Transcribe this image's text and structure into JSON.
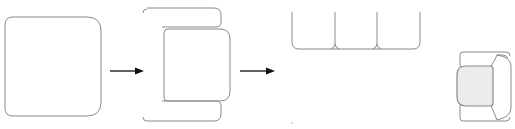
{
  "diagram": {
    "steps": [
      {
        "id": "step-1",
        "label": "rounded square block"
      },
      {
        "id": "step-2",
        "label": "armchair outline with two arms"
      },
      {
        "id": "step-3",
        "label": "three-seat sofa plan"
      },
      {
        "id": "step-4",
        "label": "shaded armchair plan"
      }
    ],
    "arrows": [
      {
        "from": "step-1",
        "to": "step-2"
      },
      {
        "from": "step-2",
        "to": "step-3"
      }
    ],
    "colors": {
      "outline": "#8a8a8a",
      "arrow": "#111111",
      "seat_fill": "#ececec",
      "background": "#ffffff"
    }
  }
}
